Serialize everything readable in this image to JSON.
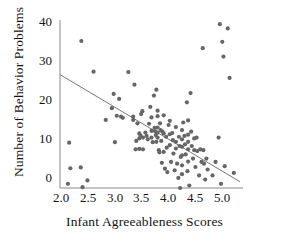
{
  "chart_data": {
    "type": "scatter",
    "title": "",
    "xlabel": "Infant Agreeableness Scores",
    "ylabel": "Number of Behavior Problems",
    "xlim": [
      2.0,
      5.0
    ],
    "ylim": [
      0,
      40
    ],
    "xticks": [
      "2.0",
      "2.5",
      "3.0",
      "3.5",
      "4.0",
      "4.5",
      "5.0"
    ],
    "xtick_values": [
      2.0,
      2.5,
      3.0,
      3.5,
      4.0,
      4.5,
      5.0
    ],
    "yticks": [
      "0",
      "10",
      "20",
      "30",
      "40"
    ],
    "ytick_values": [
      0,
      10,
      20,
      30,
      40
    ],
    "grid": false,
    "legend": null,
    "marker_color": "#666666",
    "line_color": "#666666",
    "axis_color": "#888888",
    "regression_line": {
      "x0": 2.0,
      "y0": 27.0,
      "x1": 4.95,
      "y1": 1.5
    },
    "points": [
      [
        2.13,
        1.0
      ],
      [
        2.15,
        10.8
      ],
      [
        2.17,
        4.7
      ],
      [
        2.34,
        4.9
      ],
      [
        2.35,
        35.0
      ],
      [
        2.37,
        0.2
      ],
      [
        2.45,
        1.8
      ],
      [
        2.55,
        27.7
      ],
      [
        2.75,
        16.2
      ],
      [
        2.85,
        19.0
      ],
      [
        2.88,
        22.4
      ],
      [
        2.9,
        10.9
      ],
      [
        2.93,
        17.2
      ],
      [
        2.97,
        21.2
      ],
      [
        3.0,
        17.0
      ],
      [
        3.03,
        16.7
      ],
      [
        3.12,
        27.6
      ],
      [
        3.2,
        17.0
      ],
      [
        3.2,
        16.2
      ],
      [
        3.22,
        24.6
      ],
      [
        3.24,
        9.2
      ],
      [
        3.25,
        11.2
      ],
      [
        3.27,
        15.4
      ],
      [
        3.3,
        13.0
      ],
      [
        3.3,
        11.8
      ],
      [
        3.3,
        9.3
      ],
      [
        3.32,
        12.5
      ],
      [
        3.33,
        17.6
      ],
      [
        3.35,
        18.3
      ],
      [
        3.36,
        12.0
      ],
      [
        3.36,
        9.2
      ],
      [
        3.4,
        13.2
      ],
      [
        3.42,
        12.4
      ],
      [
        3.44,
        11.6
      ],
      [
        3.46,
        15.3
      ],
      [
        3.48,
        19.3
      ],
      [
        3.5,
        16.8
      ],
      [
        3.5,
        13.6
      ],
      [
        3.5,
        12.0
      ],
      [
        3.52,
        10.9
      ],
      [
        3.54,
        22.0
      ],
      [
        3.55,
        14.3
      ],
      [
        3.56,
        13.5
      ],
      [
        3.57,
        12.6
      ],
      [
        3.58,
        23.4
      ],
      [
        3.58,
        11.0
      ],
      [
        3.6,
        18.4
      ],
      [
        3.6,
        17.1
      ],
      [
        3.6,
        14.4
      ],
      [
        3.6,
        13.2
      ],
      [
        3.6,
        12.0
      ],
      [
        3.62,
        9.0
      ],
      [
        3.63,
        8.5
      ],
      [
        3.64,
        15.4
      ],
      [
        3.65,
        13.8
      ],
      [
        3.66,
        11.2
      ],
      [
        3.67,
        6.0
      ],
      [
        3.68,
        13.4
      ],
      [
        3.7,
        17.3
      ],
      [
        3.7,
        13.0
      ],
      [
        3.7,
        8.6
      ],
      [
        3.72,
        4.6
      ],
      [
        3.74,
        12.2
      ],
      [
        3.75,
        9.6
      ],
      [
        3.76,
        3.8
      ],
      [
        3.78,
        15.0
      ],
      [
        3.8,
        16.0
      ],
      [
        3.8,
        12.8
      ],
      [
        3.8,
        10.2
      ],
      [
        3.82,
        6.2
      ],
      [
        3.84,
        13.1
      ],
      [
        3.85,
        11.4
      ],
      [
        3.86,
        8.2
      ],
      [
        3.88,
        4.2
      ],
      [
        3.9,
        14.5
      ],
      [
        3.9,
        11.0
      ],
      [
        3.9,
        9.4
      ],
      [
        3.92,
        5.8
      ],
      [
        3.94,
        2.4
      ],
      [
        3.95,
        12.2
      ],
      [
        3.96,
        10.0
      ],
      [
        3.97,
        0.0
      ],
      [
        3.98,
        7.4
      ],
      [
        4.0,
        13.8
      ],
      [
        4.0,
        11.6
      ],
      [
        4.0,
        9.8
      ],
      [
        4.0,
        7.8
      ],
      [
        4.0,
        5.4
      ],
      [
        4.0,
        3.3
      ],
      [
        4.02,
        15.6
      ],
      [
        4.04,
        12.4
      ],
      [
        4.05,
        10.4
      ],
      [
        4.06,
        8.0
      ],
      [
        4.08,
        20.4
      ],
      [
        4.09,
        4.0
      ],
      [
        4.1,
        16.1
      ],
      [
        4.1,
        12.7
      ],
      [
        4.1,
        11.0
      ],
      [
        4.1,
        9.2
      ],
      [
        4.1,
        6.3
      ],
      [
        4.12,
        0.6
      ],
      [
        4.14,
        22.6
      ],
      [
        4.15,
        13.4
      ],
      [
        4.16,
        10.0
      ],
      [
        4.18,
        7.0
      ],
      [
        4.2,
        11.8
      ],
      [
        4.2,
        9.0
      ],
      [
        4.22,
        5.0
      ],
      [
        4.24,
        12.0
      ],
      [
        4.25,
        8.8
      ],
      [
        4.28,
        3.0
      ],
      [
        4.3,
        9.2
      ],
      [
        4.32,
        6.2
      ],
      [
        4.34,
        33.3
      ],
      [
        4.35,
        9.0
      ],
      [
        4.36,
        5.8
      ],
      [
        4.38,
        2.0
      ],
      [
        4.4,
        7.0
      ],
      [
        4.42,
        4.4
      ],
      [
        4.5,
        3.0
      ],
      [
        4.55,
        6.2
      ],
      [
        4.6,
        12.0
      ],
      [
        4.62,
        39.0
      ],
      [
        4.64,
        1.0
      ],
      [
        4.66,
        34.8
      ],
      [
        4.68,
        31.3
      ],
      [
        4.7,
        5.2
      ],
      [
        4.75,
        38.0
      ],
      [
        4.78,
        26.2
      ],
      [
        4.85,
        3.6
      ]
    ]
  }
}
